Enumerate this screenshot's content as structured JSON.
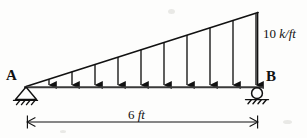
{
  "diagram": {
    "type": "beam-load-diagram",
    "labels": {
      "support_left": "A",
      "support_right": "B",
      "load_value": "10",
      "load_units": "k/ft",
      "span_value": "6",
      "span_units": "ft"
    },
    "supports": {
      "left": {
        "name": "A",
        "kind": "pin",
        "x": 26,
        "y": 87
      },
      "right": {
        "name": "B",
        "kind": "roller",
        "x": 257,
        "y": 87
      }
    },
    "beam": {
      "x1": 26,
      "y1": 87,
      "x2": 262,
      "y2": 87
    },
    "load": {
      "shape": "triangular",
      "peak_magnitude": "10 k/ft",
      "min_magnitude": "0",
      "peak_at": "B",
      "zero_at": "A",
      "arrow_count": 10,
      "direction": "downward"
    },
    "dimension": {
      "label": "6 ft",
      "x1": 27,
      "x2": 258,
      "y": 122
    },
    "colors": {
      "ink": "#111111",
      "background": "#fdfdfc",
      "beam": "#3a3a3a"
    }
  }
}
